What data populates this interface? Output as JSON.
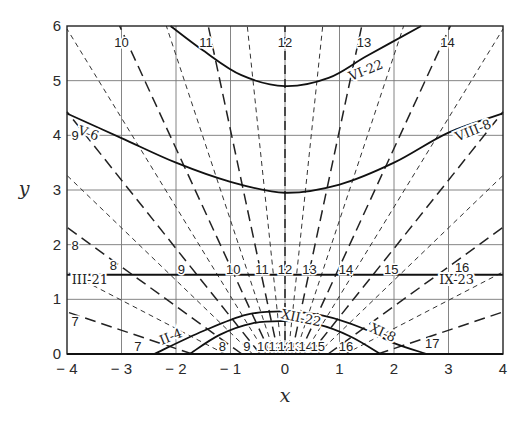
{
  "chart_data": {
    "type": "line",
    "title": "",
    "xlabel": "x",
    "ylabel": "y",
    "xlim": [
      -4,
      4
    ],
    "ylim": [
      0,
      6
    ],
    "grid": true,
    "x_ticks": [
      "-4",
      "-3",
      "-2",
      "-1",
      "0",
      "1",
      "2",
      "3",
      "4"
    ],
    "y_ticks": [
      "0",
      "1",
      "2",
      "3",
      "4",
      "5",
      "6"
    ],
    "hour_lines": {
      "focus": [
        0,
        -0.57
      ],
      "scale_k": 0.8,
      "full_hours": [
        7,
        8,
        9,
        10,
        11,
        12,
        13,
        14,
        15,
        16,
        17
      ],
      "half_hours": [
        7.5,
        8.5,
        9.5,
        10.5,
        11.5,
        12.5,
        13.5,
        14.5,
        15.5,
        16.5
      ],
      "style_full": "long-dash",
      "style_half": "short-dash"
    },
    "date_curves": [
      {
        "name": "VI-22",
        "points": [
          [
            -2.1,
            6.0
          ],
          [
            -1.5,
            5.55
          ],
          [
            -0.8,
            5.1
          ],
          [
            0,
            4.9
          ],
          [
            0.8,
            5.05
          ],
          [
            1.5,
            5.45
          ],
          [
            2.5,
            6.0
          ]
        ]
      },
      {
        "name": "V-6 / VIII-8",
        "points": [
          [
            -4,
            4.4
          ],
          [
            -3,
            3.95
          ],
          [
            -2,
            3.5
          ],
          [
            -1,
            3.15
          ],
          [
            0,
            2.95
          ],
          [
            1,
            3.1
          ],
          [
            2,
            3.5
          ],
          [
            3,
            4.05
          ],
          [
            4,
            4.4
          ]
        ]
      },
      {
        "name": "III-21 / IX-23",
        "points": [
          [
            -4,
            1.45
          ],
          [
            4,
            1.45
          ]
        ]
      },
      {
        "name": "II-4 / XI-8",
        "points": [
          [
            -2.4,
            0.0
          ],
          [
            -1.5,
            0.42
          ],
          [
            -0.7,
            0.72
          ],
          [
            0,
            0.78
          ],
          [
            0.7,
            0.7
          ],
          [
            1.4,
            0.48
          ],
          [
            2.0,
            0.2
          ],
          [
            2.6,
            0.0
          ]
        ]
      },
      {
        "name": "XII-22",
        "points": [
          [
            -1.75,
            0.0
          ],
          [
            -1.2,
            0.35
          ],
          [
            -0.6,
            0.56
          ],
          [
            0,
            0.6
          ],
          [
            0.6,
            0.54
          ],
          [
            1.2,
            0.32
          ],
          [
            1.75,
            0.0
          ]
        ]
      }
    ],
    "curve_labels": [
      {
        "text": "VI-22",
        "x": 1.48,
        "y": 5.2,
        "angle": -22
      },
      {
        "text": "V-6",
        "x": -3.6,
        "y": 4.05,
        "angle": 18
      },
      {
        "text": "VIII-8",
        "x": 3.45,
        "y": 4.1,
        "angle": -22
      },
      {
        "text": "III-21",
        "x": -3.58,
        "y": 1.37,
        "angle": 0
      },
      {
        "text": "IX-23",
        "x": 3.15,
        "y": 1.37,
        "angle": 0
      },
      {
        "text": "II-4",
        "x": -2.1,
        "y": 0.33,
        "angle": -22
      },
      {
        "text": "XI-8",
        "x": 1.8,
        "y": 0.4,
        "angle": 25
      },
      {
        "text": "XII-22",
        "x": 0.3,
        "y": 0.67,
        "angle": 12
      }
    ],
    "hour_labels": [
      {
        "text": "10",
        "x": -3.0,
        "y": 5.7
      },
      {
        "text": "11",
        "x": -1.45,
        "y": 5.7
      },
      {
        "text": "12",
        "x": 0.0,
        "y": 5.7
      },
      {
        "text": "13",
        "x": 1.45,
        "y": 5.7
      },
      {
        "text": "14",
        "x": 2.98,
        "y": 5.7
      },
      {
        "text": "9",
        "x": -3.85,
        "y": 4.0
      },
      {
        "text": "8",
        "x": -3.85,
        "y": 2.0
      },
      {
        "text": "8",
        "x": -3.15,
        "y": 1.62
      },
      {
        "text": "9",
        "x": -1.9,
        "y": 1.55
      },
      {
        "text": "10",
        "x": -0.95,
        "y": 1.55
      },
      {
        "text": "11",
        "x": -0.42,
        "y": 1.55
      },
      {
        "text": "12",
        "x": 0.0,
        "y": 1.55
      },
      {
        "text": "13",
        "x": 0.45,
        "y": 1.55
      },
      {
        "text": "14",
        "x": 1.12,
        "y": 1.55
      },
      {
        "text": "15",
        "x": 1.95,
        "y": 1.55
      },
      {
        "text": "16",
        "x": 3.25,
        "y": 1.6
      },
      {
        "text": "7",
        "x": -3.85,
        "y": 0.6
      },
      {
        "text": "7",
        "x": -2.7,
        "y": 0.15
      },
      {
        "text": "8",
        "x": -1.15,
        "y": 0.15
      },
      {
        "text": "9",
        "x": -0.7,
        "y": 0.15
      },
      {
        "text": "10",
        "x": -0.38,
        "y": 0.15
      },
      {
        "text": "11",
        "x": -0.18,
        "y": 0.15
      },
      {
        "text": "12",
        "x": 0.0,
        "y": 0.15
      },
      {
        "text": "13",
        "x": 0.18,
        "y": 0.15
      },
      {
        "text": "14",
        "x": 0.38,
        "y": 0.15
      },
      {
        "text": "15",
        "x": 0.6,
        "y": 0.15
      },
      {
        "text": "16",
        "x": 1.12,
        "y": 0.15
      },
      {
        "text": "17",
        "x": 2.7,
        "y": 0.2
      }
    ]
  },
  "axes": {
    "x_label": "x",
    "y_label": "y"
  }
}
